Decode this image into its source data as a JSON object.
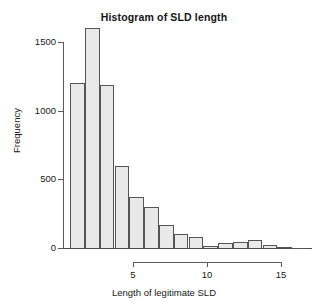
{
  "chart_data": {
    "type": "bar",
    "subtype": "histogram",
    "title": "Histogram of SLD length",
    "xlabel": "Length of legitimate SLD",
    "ylabel": "Frequency",
    "grid": false,
    "legend": null,
    "xlim": [
      0.75,
      17.0
    ],
    "ylim": [
      0,
      1650
    ],
    "bin_width": 1,
    "x_ticks": [
      5,
      10,
      15
    ],
    "x_tick_labels": [
      "5",
      "10",
      "15"
    ],
    "y_ticks": [
      0,
      500,
      1000,
      1500
    ],
    "y_tick_labels": [
      "0",
      "500",
      "1000",
      "1500"
    ],
    "bin_edges": [
      0.75,
      1.75,
      2.75,
      3.75,
      4.75,
      5.75,
      6.75,
      7.75,
      8.75,
      9.75,
      10.75,
      11.75,
      12.75,
      13.75,
      14.75,
      15.75,
      16.75
    ],
    "categories": [
      "1",
      "2",
      "3",
      "4",
      "5",
      "6",
      "7",
      "8",
      "9",
      "10",
      "11",
      "12",
      "13",
      "14",
      "15",
      "16"
    ],
    "values": [
      1200,
      1600,
      1190,
      600,
      370,
      300,
      170,
      105,
      80,
      18,
      38,
      45,
      55,
      22,
      5,
      2
    ],
    "bars": [
      {
        "label": "bin-1",
        "x_center": 1.25,
        "value": 1200
      },
      {
        "label": "bin-2",
        "x_center": 2.25,
        "value": 1600
      },
      {
        "label": "bin-3",
        "x_center": 3.25,
        "value": 1190
      },
      {
        "label": "bin-4",
        "x_center": 4.25,
        "value": 600
      },
      {
        "label": "bin-5",
        "x_center": 5.25,
        "value": 370
      },
      {
        "label": "bin-6",
        "x_center": 6.25,
        "value": 300
      },
      {
        "label": "bin-7",
        "x_center": 7.25,
        "value": 170
      },
      {
        "label": "bin-8",
        "x_center": 8.25,
        "value": 105
      },
      {
        "label": "bin-9",
        "x_center": 9.25,
        "value": 80
      },
      {
        "label": "bin-10",
        "x_center": 10.25,
        "value": 18
      },
      {
        "label": "bin-11",
        "x_center": 11.25,
        "value": 38
      },
      {
        "label": "bin-12",
        "x_center": 12.25,
        "value": 45
      },
      {
        "label": "bin-13",
        "x_center": 13.25,
        "value": 55
      },
      {
        "label": "bin-14",
        "x_center": 14.25,
        "value": 22
      },
      {
        "label": "bin-15",
        "x_center": 15.25,
        "value": 5
      },
      {
        "label": "bin-16",
        "x_center": 16.25,
        "value": 2
      }
    ],
    "colors": {
      "bar_fill": "#e9e9e9",
      "bar_border": "#555555",
      "axis": "#5a5a5a",
      "text": "#171717",
      "background": "#ffffff"
    }
  }
}
